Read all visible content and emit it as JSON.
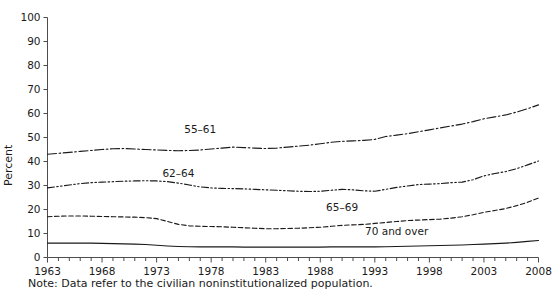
{
  "chart_data": {
    "type": "line",
    "title": "",
    "xlabel": "",
    "ylabel": "Percent",
    "xlim": [
      1963,
      2008
    ],
    "ylim": [
      0,
      100
    ],
    "ytick_step": 10,
    "xtick_step": 1,
    "xtick_label_step": 5,
    "grid": false,
    "legend_position": "inline-labels",
    "note": "Note: Data refer to the civilian noninstitutionalized population.",
    "ytick_labels": [
      "0",
      "10",
      "20",
      "30",
      "40",
      "50",
      "60",
      "70",
      "80",
      "90",
      "100"
    ],
    "xtick_labels": [
      "1963",
      "1968",
      "1973",
      "1978",
      "1983",
      "1988",
      "1993",
      "1998",
      "2003",
      "2008"
    ],
    "x": [
      1963,
      1964,
      1965,
      1966,
      1967,
      1968,
      1969,
      1970,
      1971,
      1972,
      1973,
      1974,
      1975,
      1976,
      1977,
      1978,
      1979,
      1980,
      1981,
      1982,
      1983,
      1984,
      1985,
      1986,
      1987,
      1988,
      1989,
      1990,
      1991,
      1992,
      1993,
      1994,
      1995,
      1996,
      1997,
      1998,
      1999,
      2000,
      2001,
      2002,
      2003,
      2004,
      2005,
      2006,
      2007,
      2008
    ],
    "series": [
      {
        "name": "55–61",
        "label": "55–61",
        "style": "dash-dot",
        "label_x": 1977,
        "label_y": 52.0,
        "values": [
          43.0,
          43.4,
          43.8,
          44.2,
          44.6,
          45.0,
          45.3,
          45.4,
          45.2,
          45.0,
          44.8,
          44.6,
          44.5,
          44.6,
          44.8,
          45.2,
          45.6,
          46.0,
          45.8,
          45.6,
          45.4,
          45.6,
          46.0,
          46.4,
          46.8,
          47.4,
          48.0,
          48.4,
          48.6,
          48.8,
          49.2,
          50.4,
          51.0,
          51.6,
          52.4,
          53.2,
          54.0,
          54.8,
          55.6,
          56.6,
          57.8,
          58.6,
          59.4,
          60.6,
          62.0,
          63.6
        ]
      },
      {
        "name": "62–64",
        "label": "62–64",
        "style": "dash-dot-dot",
        "label_x": 1975,
        "label_y": 33.5,
        "values": [
          29.0,
          29.6,
          30.2,
          30.8,
          31.2,
          31.4,
          31.6,
          31.8,
          31.9,
          32.0,
          31.9,
          31.6,
          31.0,
          30.2,
          29.4,
          29.0,
          28.8,
          28.7,
          28.6,
          28.4,
          28.2,
          28.0,
          27.8,
          27.6,
          27.5,
          27.6,
          28.0,
          28.4,
          28.2,
          27.8,
          27.6,
          28.4,
          29.2,
          29.8,
          30.4,
          30.6,
          30.8,
          31.2,
          31.4,
          32.4,
          34.0,
          35.0,
          35.8,
          37.0,
          38.6,
          40.2
        ]
      },
      {
        "name": "65–69",
        "label": "65–69",
        "style": "dashed",
        "label_x": 1990,
        "label_y": 19.5,
        "values": [
          17.0,
          17.2,
          17.3,
          17.3,
          17.2,
          17.1,
          17.0,
          16.9,
          16.8,
          16.6,
          16.2,
          15.0,
          13.8,
          13.2,
          13.0,
          12.9,
          12.8,
          12.6,
          12.4,
          12.2,
          12.0,
          12.0,
          12.1,
          12.2,
          12.4,
          12.6,
          13.0,
          13.4,
          13.6,
          13.8,
          14.2,
          14.6,
          15.0,
          15.4,
          15.6,
          15.8,
          16.0,
          16.4,
          17.0,
          17.8,
          18.8,
          19.6,
          20.4,
          21.6,
          23.0,
          24.8
        ]
      },
      {
        "name": "70 and over",
        "label": "70 and over",
        "style": "solid",
        "label_x": 1995,
        "label_y": 9.3,
        "values": [
          6.0,
          6.0,
          6.0,
          6.0,
          6.0,
          5.9,
          5.8,
          5.7,
          5.6,
          5.4,
          5.1,
          4.8,
          4.6,
          4.5,
          4.4,
          4.4,
          4.4,
          4.4,
          4.3,
          4.3,
          4.3,
          4.3,
          4.3,
          4.3,
          4.3,
          4.3,
          4.4,
          4.4,
          4.4,
          4.4,
          4.4,
          4.5,
          4.6,
          4.7,
          4.8,
          4.9,
          5.0,
          5.1,
          5.2,
          5.4,
          5.6,
          5.8,
          6.0,
          6.3,
          6.7,
          7.1
        ]
      }
    ]
  }
}
